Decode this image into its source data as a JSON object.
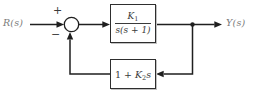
{
  "diagram": {
    "title_hint": "negative-feedback control system block diagram",
    "input_signal": "R(s)",
    "output_signal": "Y(s)",
    "summing_junction": {
      "top_sign": "+",
      "bottom_sign": "−"
    },
    "forward_block": {
      "numerator_base": "K",
      "numerator_subscript": "1",
      "denominator": "s(s + 1)"
    },
    "feedback_block": {
      "coefficient": "1 + ",
      "gain_base": "K",
      "gain_subscript": "2",
      "variable": "s"
    }
  },
  "colors": {
    "line": "#1f1f1f",
    "block_border": "#2e2e2e",
    "block_text": "#3a3a3a",
    "signal_label": "#7a7a7a",
    "background": "#ffffff"
  }
}
